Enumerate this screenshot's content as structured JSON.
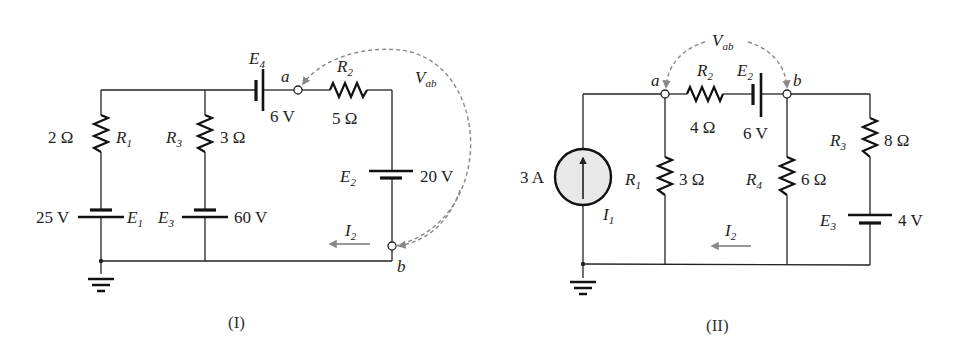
{
  "figures": [
    {
      "caption": "(I)",
      "components": {
        "R1": {
          "name": "R",
          "sub": "1",
          "value": "2 Ω"
        },
        "R2": {
          "name": "R",
          "sub": "2",
          "value": "5 Ω"
        },
        "R3": {
          "name": "R",
          "sub": "3",
          "value": "3 Ω"
        },
        "E1": {
          "name": "E",
          "sub": "1",
          "value": "25 V"
        },
        "E2": {
          "name": "E",
          "sub": "2",
          "value": "20 V"
        },
        "E3": {
          "name": "E",
          "sub": "3",
          "value": "60 V"
        },
        "E4": {
          "name": "E",
          "sub": "4",
          "value": "6 V"
        }
      },
      "nodes": {
        "a": "a",
        "b": "b"
      },
      "voltage": {
        "name": "V",
        "sub": "ab"
      },
      "current": {
        "name": "I",
        "sub": "2"
      }
    },
    {
      "caption": "(II)",
      "components": {
        "I1": {
          "name": "I",
          "sub": "1",
          "value": "3 A"
        },
        "R1": {
          "name": "R",
          "sub": "1",
          "value": "3 Ω"
        },
        "R2": {
          "name": "R",
          "sub": "2",
          "value": "4 Ω"
        },
        "R3": {
          "name": "R",
          "sub": "3",
          "value": "8 Ω"
        },
        "R4": {
          "name": "R",
          "sub": "4",
          "value": "6 Ω"
        },
        "E2": {
          "name": "E",
          "sub": "2",
          "value": "6 V"
        },
        "E3": {
          "name": "E",
          "sub": "3",
          "value": "4 V"
        }
      },
      "nodes": {
        "a": "a",
        "b": "b"
      },
      "voltage": {
        "name": "V",
        "sub": "ab"
      },
      "current": {
        "name": "I",
        "sub": "2"
      }
    }
  ],
  "colors": {
    "wire": "#222222",
    "dashed_arrow": "#888888",
    "current_source_fill": "#e8e8e8"
  }
}
